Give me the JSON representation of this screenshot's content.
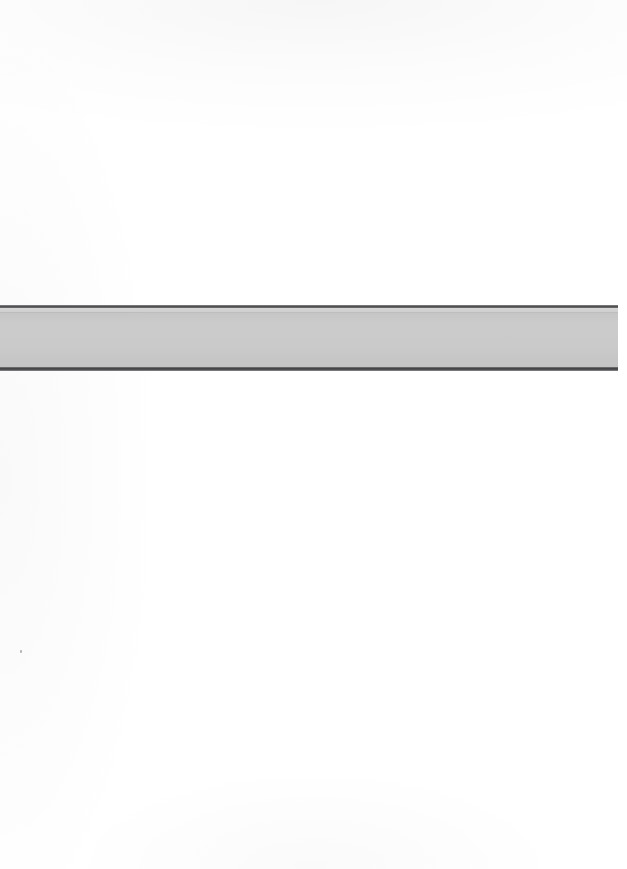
{
  "document": {
    "kind": "scanned-page",
    "page_background": "#ffffff",
    "width": 627,
    "height": 869,
    "text_content": "",
    "notes": "Blank scanned page containing a single horizontal gray band; no text is rendered anywhere in the image."
  },
  "band": {
    "name": "horizontal-gray-band",
    "fill_color": "#cacaca",
    "highlight_color": "#d6d6d6",
    "rule_color": "#4e4e50",
    "left": 0,
    "top": 305,
    "width": 618,
    "height": 66
  },
  "artifacts": {
    "speck_color": "#787a7d"
  }
}
